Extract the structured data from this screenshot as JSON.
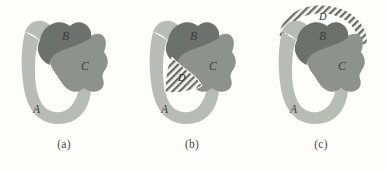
{
  "figure": {
    "background_color": "#fdfdfc",
    "panel_count": 3
  },
  "legend_colors": {
    "region_a_fill": "#b9bbb6",
    "region_b_fill": "#6e706d",
    "region_c_fill": "#8f918d",
    "region_d_hatch_line": "#6b6b6b",
    "region_d_hatch_background": "#f7f7f5",
    "outline": "#ffffff",
    "label_text": "#3c3c3c",
    "caption_text": "#4a4a4a"
  },
  "panels": [
    {
      "id": "a",
      "caption": "(a)",
      "regions": [
        {
          "key": "a",
          "label": "A",
          "fill": "#b9bbb6",
          "style": "solid"
        },
        {
          "key": "b",
          "label": "B",
          "fill": "#6e706d",
          "style": "solid"
        },
        {
          "key": "c",
          "label": "C",
          "fill": "#8f918d",
          "style": "solid"
        }
      ]
    },
    {
      "id": "b",
      "caption": "(b)",
      "regions": [
        {
          "key": "a",
          "label": "A",
          "fill": "#b9bbb6",
          "style": "solid"
        },
        {
          "key": "b",
          "label": "B",
          "fill": "#6e706d",
          "style": "solid"
        },
        {
          "key": "c",
          "label": "C",
          "fill": "#8f918d",
          "style": "solid"
        },
        {
          "key": "d",
          "label": "D",
          "fill": "#f7f7f5",
          "style": "diagonal-hatch",
          "shape": "wedge-inside-hole"
        }
      ]
    },
    {
      "id": "c",
      "caption": "(c)",
      "regions": [
        {
          "key": "a",
          "label": "A",
          "fill": "#b9bbb6",
          "style": "solid"
        },
        {
          "key": "b",
          "label": "B",
          "fill": "#6e706d",
          "style": "solid"
        },
        {
          "key": "c",
          "label": "C",
          "fill": "#8f918d",
          "style": "solid"
        },
        {
          "key": "d",
          "label": "D",
          "fill": "#f7f7f5",
          "style": "diagonal-hatch",
          "shape": "outer-arc-band"
        }
      ]
    }
  ],
  "labels": {
    "a": "A",
    "b": "B",
    "c": "C",
    "d": "D"
  },
  "captions": {
    "a": "(a)",
    "b": "(b)",
    "c": "(c)"
  }
}
